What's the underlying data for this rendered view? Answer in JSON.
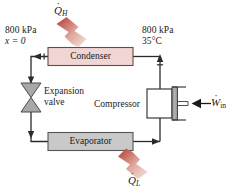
{
  "figure": {
    "type": "refrigeration-cycle-schematic"
  },
  "components": {
    "condenser": {
      "label": "Condenser",
      "fill": "#f0d6d2",
      "stroke": "#6b4a45"
    },
    "evaporator": {
      "label": "Evaporator",
      "fill": "#c9c9c9",
      "stroke": "#555555"
    },
    "expansion_valve": {
      "label_line1": "Expansion",
      "label_line2": "valve",
      "fill": "#a8a8a8",
      "stroke": "#4a4a4a"
    },
    "compressor": {
      "label": "Compressor",
      "fill": "#ffffff",
      "stroke": "#3a3a3a",
      "piston_fill": "#9a9a9a"
    }
  },
  "state_labels": {
    "condenser_inlet_pressure": "800 kPa",
    "condenser_inlet_quality": "x = 0",
    "compressor_exit_pressure": "800 kPa",
    "compressor_exit_temperature": "35°C"
  },
  "energy_flows": {
    "heat_rejected": {
      "symbol": "Q",
      "dot": "˙",
      "subscript": "H",
      "description": "heat rejected from condenser",
      "color": "#b5392f"
    },
    "heat_absorbed": {
      "symbol": "Q",
      "dot": "˙",
      "subscript": "L",
      "description": "heat absorbed by evaporator",
      "color": "#b5392f"
    },
    "work_input": {
      "symbol": "W",
      "dot": "˙",
      "subscript": "in",
      "description": "work input to compressor",
      "color": "#1a1a1a"
    }
  },
  "colors": {
    "pipe": "#2b2b2b",
    "background": "#ffffff",
    "arrow_red_dark": "#b33b30",
    "arrow_red_light": "#f3ddd8"
  }
}
